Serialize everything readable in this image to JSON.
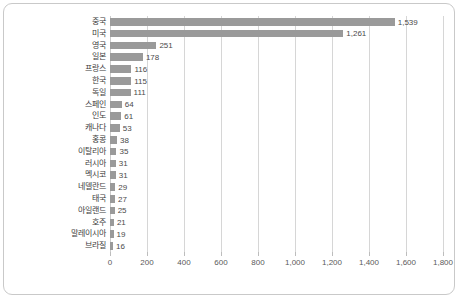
{
  "chart_data": {
    "type": "bar",
    "orientation": "horizontal",
    "title": "",
    "subtitle": "",
    "xlabel": "",
    "ylabel": "",
    "categories": [
      "중국",
      "미국",
      "영국",
      "일본",
      "프랑스",
      "한국",
      "독일",
      "스페인",
      "인도",
      "캐나다",
      "홍콩",
      "이탈리아",
      "러시아",
      "멕시코",
      "네델란드",
      "태국",
      "아일랜드",
      "호주",
      "말레이시아",
      "브라질"
    ],
    "values": [
      1539,
      1261,
      251,
      178,
      116,
      115,
      111,
      64,
      61,
      53,
      38,
      35,
      31,
      31,
      29,
      27,
      25,
      21,
      19,
      16
    ],
    "value_labels": [
      "1,539",
      "1,261",
      "251",
      "178",
      "116",
      "115",
      "111",
      "64",
      "61",
      "53",
      "38",
      "35",
      "31",
      "31",
      "29",
      "27",
      "25",
      "21",
      "19",
      "16"
    ],
    "xlim": [
      0,
      1800
    ],
    "xticks": [
      0,
      200,
      400,
      600,
      800,
      1000,
      1200,
      1400,
      1600,
      1800
    ],
    "xtick_labels": [
      "0",
      "200",
      "400",
      "600",
      "800",
      "1,000",
      "1,200",
      "1,400",
      "1,600",
      "1,800"
    ],
    "grid": true,
    "grid_axis": "x",
    "legend": false,
    "legend_position": "none",
    "bar_color": "#9a9a9a",
    "gridline_color": "#d6d6d6",
    "text_color": "#3c3c3c",
    "frame_color": "#c9c9c9",
    "background": "#ffffff"
  }
}
